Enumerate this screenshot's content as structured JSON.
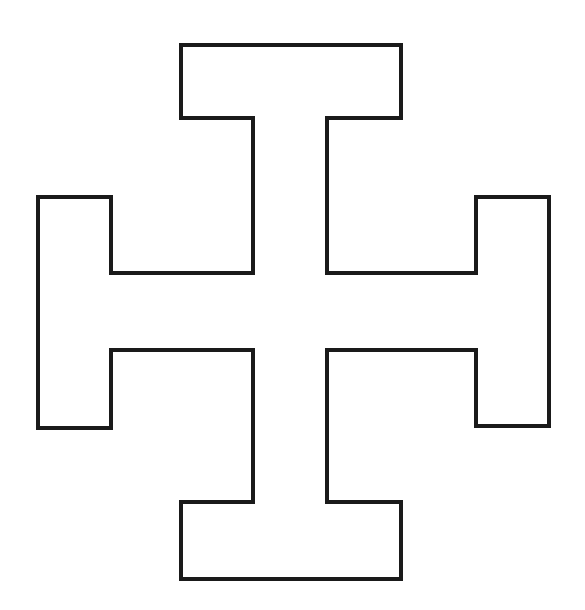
{
  "figure": {
    "description": "Cross potent (Jerusalem-style T-cross) outline",
    "shape": "cross-potent",
    "background_color": "#ffffff",
    "stroke_color": "#1a1a1a",
    "stroke_width": 4,
    "fill": "none",
    "points": [
      [
        181,
        45
      ],
      [
        401,
        45
      ],
      [
        401,
        118
      ],
      [
        327,
        118
      ],
      [
        327,
        273
      ],
      [
        476,
        273
      ],
      [
        476,
        197
      ],
      [
        549,
        197
      ],
      [
        549,
        426
      ],
      [
        476,
        426
      ],
      [
        476,
        350
      ],
      [
        327,
        350
      ],
      [
        327,
        502
      ],
      [
        401,
        502
      ],
      [
        401,
        579
      ],
      [
        181,
        579
      ],
      [
        181,
        502
      ],
      [
        253,
        502
      ],
      [
        253,
        350
      ],
      [
        111,
        350
      ],
      [
        111,
        428
      ],
      [
        38,
        428
      ],
      [
        38,
        197
      ],
      [
        111,
        197
      ],
      [
        111,
        273
      ],
      [
        253,
        273
      ],
      [
        253,
        118
      ],
      [
        181,
        118
      ]
    ],
    "arms": [
      {
        "name": "top",
        "bar": {
          "x": [
            181,
            401
          ],
          "y": [
            45,
            118
          ]
        }
      },
      {
        "name": "right",
        "bar": {
          "x": [
            476,
            549
          ],
          "y": [
            197,
            426
          ]
        }
      },
      {
        "name": "bottom",
        "bar": {
          "x": [
            181,
            401
          ],
          "y": [
            502,
            579
          ]
        }
      },
      {
        "name": "left",
        "bar": {
          "x": [
            38,
            111
          ],
          "y": [
            197,
            428
          ]
        }
      }
    ],
    "center_stem": {
      "x": [
        253,
        327
      ],
      "y": [
        273,
        350
      ]
    }
  }
}
